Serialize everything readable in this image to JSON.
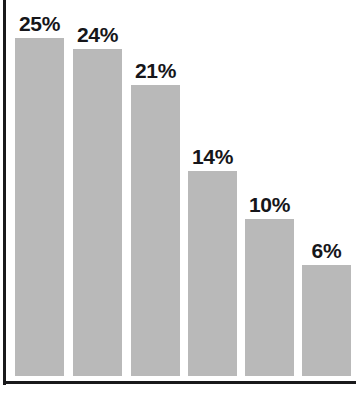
{
  "chart_data": {
    "type": "bar",
    "title": "",
    "subtitle": "",
    "xlabel": "",
    "ylabel": "",
    "categories": [
      "",
      "",
      "",
      "",
      "",
      ""
    ],
    "values": [
      25,
      24,
      21,
      14,
      10,
      6
    ],
    "data_labels": [
      "25%",
      "24%",
      "21%",
      "14%",
      "10%",
      "6%"
    ],
    "ylim": [
      0,
      28
    ],
    "grid": false,
    "legend": false,
    "legend_position": "none",
    "tick_labels": {
      "x": [],
      "y": []
    },
    "bar_color": "#b9b9b9",
    "label_color": "#16161a",
    "axis_color": "#19191b",
    "background_color": "#ffffff",
    "annotations": []
  },
  "bars": [
    {
      "label": "25%",
      "value": 25,
      "left": 15,
      "width": 49,
      "top": 38
    },
    {
      "label": "24%",
      "value": 24,
      "left": 73,
      "width": 49,
      "top": 49
    },
    {
      "label": "21%",
      "value": 21,
      "left": 131,
      "width": 49,
      "top": 85
    },
    {
      "label": "14%",
      "value": 14,
      "left": 188,
      "width": 49,
      "top": 171
    },
    {
      "label": "10%",
      "value": 10,
      "left": 245,
      "width": 49,
      "top": 219
    },
    {
      "label": "6%",
      "value": 6,
      "left": 302,
      "width": 49,
      "top": 265
    }
  ]
}
